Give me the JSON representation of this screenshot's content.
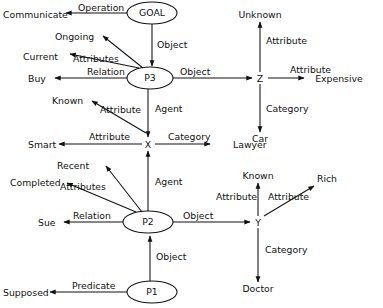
{
  "diagram": {
    "background_color": "#ffffff",
    "stroke_color": "#111111",
    "nodes": [
      {
        "id": "goal",
        "label": "GOAL",
        "shape": "ellipse",
        "cx": 152,
        "cy": 13,
        "rx": 25,
        "ry": 11
      },
      {
        "id": "p3",
        "label": "P3",
        "shape": "ellipse",
        "cx": 150,
        "cy": 78,
        "rx": 23,
        "ry": 11
      },
      {
        "id": "p2",
        "label": "P2",
        "shape": "ellipse",
        "cx": 148,
        "cy": 222,
        "rx": 25,
        "ry": 11
      },
      {
        "id": "p1",
        "label": "P1",
        "shape": "ellipse",
        "cx": 152,
        "cy": 292,
        "rx": 25,
        "ry": 11
      },
      {
        "id": "x",
        "label": "X",
        "shape": "plain",
        "cx": 148,
        "cy": 144
      },
      {
        "id": "y",
        "label": "Y",
        "shape": "plain",
        "cx": 258,
        "cy": 222
      },
      {
        "id": "z",
        "label": "Z",
        "shape": "plain",
        "cx": 260,
        "cy": 78
      }
    ],
    "terminals": [
      {
        "id": "communicate",
        "label": "Communicate",
        "x": 3,
        "y": 15,
        "anchor": "start"
      },
      {
        "id": "ongoing",
        "label": "Ongoing",
        "x": 55,
        "y": 38,
        "anchor": "start"
      },
      {
        "id": "current",
        "label": "Current",
        "x": 23,
        "y": 58,
        "anchor": "start"
      },
      {
        "id": "buy",
        "label": "Buy",
        "x": 28,
        "y": 82,
        "anchor": "start"
      },
      {
        "id": "known-upper",
        "label": "Known",
        "x": 52,
        "y": 104,
        "anchor": "start"
      },
      {
        "id": "smart",
        "label": "Smart",
        "x": 28,
        "y": 148,
        "anchor": "start"
      },
      {
        "id": "recent",
        "label": "Recent",
        "x": 57,
        "y": 168,
        "anchor": "start"
      },
      {
        "id": "completed",
        "label": "Completed",
        "x": 10,
        "y": 186,
        "anchor": "start"
      },
      {
        "id": "sue",
        "label": "Sue",
        "x": 38,
        "y": 226,
        "anchor": "start"
      },
      {
        "id": "supposed",
        "label": "Supposed",
        "x": 3,
        "y": 295,
        "anchor": "start"
      },
      {
        "id": "unknown",
        "label": "Unknown",
        "x": 260,
        "y": 15,
        "anchor": "middle"
      },
      {
        "id": "expensive",
        "label": "Expensive",
        "x": 336,
        "y": 82,
        "anchor": "middle"
      },
      {
        "id": "car",
        "label": "Car",
        "x": 260,
        "y": 140,
        "anchor": "middle"
      },
      {
        "id": "lawyer",
        "label": "Lawyer",
        "x": 235,
        "y": 148,
        "anchor": "middle"
      },
      {
        "id": "known-lower",
        "label": "Known",
        "x": 258,
        "y": 176,
        "anchor": "middle"
      },
      {
        "id": "rich",
        "label": "Rich",
        "x": 327,
        "y": 180,
        "anchor": "middle"
      },
      {
        "id": "doctor",
        "label": "Doctor",
        "x": 258,
        "y": 290,
        "anchor": "middle"
      }
    ],
    "edges": [
      {
        "id": "goal-communicate",
        "from": "goal",
        "to": "communicate",
        "label": "Operation",
        "label_x": 78,
        "label_y": 11
      },
      {
        "id": "goal-p3",
        "from": "goal",
        "to": "p3",
        "label": "Object",
        "label_x": 157,
        "label_y": 48
      },
      {
        "id": "p3-ongoing",
        "from": "p3",
        "to": "ongoing",
        "label": "Attributes",
        "label_x": 73,
        "label_y": 62
      },
      {
        "id": "p3-current",
        "from": "p3",
        "to": "current",
        "label": "",
        "label_x": 0,
        "label_y": 0
      },
      {
        "id": "p3-buy",
        "from": "p3",
        "to": "buy",
        "label": "Relation",
        "label_x": 87,
        "label_y": 78
      },
      {
        "id": "p3-z",
        "from": "p3",
        "to": "z",
        "label": "Object",
        "label_x": 198,
        "label_y": 74
      },
      {
        "id": "p3-known",
        "from": "p3",
        "to": "known-upper",
        "label": "Attribute",
        "label_x": 100,
        "label_y": 113
      },
      {
        "id": "p3-x",
        "from": "p3",
        "to": "x",
        "label": "Agent",
        "label_x": 155,
        "label_y": 112
      },
      {
        "id": "z-unknown",
        "from": "z",
        "to": "unknown",
        "label": "Attribute",
        "label_x": 266,
        "label_y": 44
      },
      {
        "id": "z-expensive",
        "from": "z",
        "to": "expensive",
        "label": "Attribute",
        "label_x": 290,
        "label_y": 73
      },
      {
        "id": "z-car",
        "from": "z",
        "to": "car",
        "label": "Category",
        "label_x": 266,
        "label_y": 112
      },
      {
        "id": "x-smart",
        "from": "x",
        "to": "smart",
        "label": "Attribute",
        "label_x": 89,
        "label_y": 140
      },
      {
        "id": "x-lawyer",
        "from": "x",
        "to": "lawyer",
        "label": "Category",
        "label_x": 168,
        "label_y": 140
      },
      {
        "id": "p2-recent",
        "from": "p2",
        "to": "recent",
        "label": "Attributes",
        "label_x": 60,
        "label_y": 187
      },
      {
        "id": "p2-completed",
        "from": "p2",
        "to": "completed",
        "label": "",
        "label_x": 0,
        "label_y": 0
      },
      {
        "id": "p2-sue",
        "from": "p2",
        "to": "sue",
        "label": "Relation",
        "label_x": 73,
        "label_y": 217
      },
      {
        "id": "p2-x",
        "from": "p2",
        "to": "x",
        "label": "Agent",
        "label_x": 155,
        "label_y": 185
      },
      {
        "id": "p2-y",
        "from": "p2",
        "to": "y",
        "label": "Object",
        "label_x": 195,
        "label_y": 217
      },
      {
        "id": "p1-supposed",
        "from": "p1",
        "to": "supposed",
        "label": "Predicate",
        "label_x": 72,
        "label_y": 288
      },
      {
        "id": "p1-p2",
        "from": "p1",
        "to": "p2",
        "label": "Object",
        "label_x": 155,
        "label_y": 260
      },
      {
        "id": "y-known",
        "from": "y",
        "to": "known-lower",
        "label": "Attribute",
        "label_x": 216,
        "label_y": 200
      },
      {
        "id": "y-rich",
        "from": "y",
        "to": "rich",
        "label": "Attribute",
        "label_x": 268,
        "label_y": 200
      },
      {
        "id": "y-doctor",
        "from": "y",
        "to": "doctor",
        "label": "Category",
        "label_x": 265,
        "label_y": 253
      }
    ]
  }
}
